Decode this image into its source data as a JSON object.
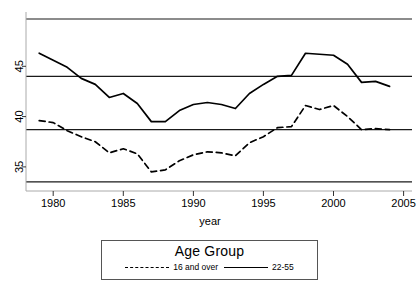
{
  "chart_data": {
    "type": "line",
    "title": "",
    "xlabel": "year",
    "ylabel": "",
    "xlim": [
      1978.2,
      2005.6
    ],
    "ylim": [
      32.6,
      50.4
    ],
    "xticks": [
      1980,
      1985,
      1990,
      1995,
      2000,
      2005
    ],
    "yticks": [
      35,
      40,
      45
    ],
    "grid": false,
    "reference_lines": [
      49.7,
      44.0,
      38.7,
      33.5
    ],
    "legend": {
      "title": "Age Group",
      "position": "below-axes",
      "entries": [
        {
          "label": "16 and over",
          "style": "dashed"
        },
        {
          "label": "22-55",
          "style": "solid"
        }
      ]
    },
    "x": [
      1979,
      1980,
      1981,
      1982,
      1983,
      1984,
      1985,
      1986,
      1987,
      1988,
      1989,
      1990,
      1991,
      1992,
      1993,
      1994,
      1995,
      1996,
      1997,
      1998,
      1999,
      2000,
      2001,
      2002,
      2003,
      2004
    ],
    "series": [
      {
        "name": "22-55",
        "style": "solid",
        "values": [
          46.3,
          45.6,
          44.9,
          43.8,
          43.2,
          41.9,
          42.3,
          41.3,
          39.5,
          39.5,
          40.6,
          41.2,
          41.4,
          41.2,
          40.8,
          42.3,
          43.2,
          44.0,
          44.1,
          46.3,
          46.2,
          46.1,
          45.2,
          43.4,
          43.5,
          43.0
        ]
      },
      {
        "name": "16 and over",
        "style": "dashed",
        "values": [
          39.6,
          39.4,
          38.6,
          38.0,
          37.5,
          36.4,
          36.8,
          36.3,
          34.5,
          34.7,
          35.6,
          36.2,
          36.5,
          36.4,
          36.1,
          37.4,
          38.0,
          38.9,
          39.0,
          41.1,
          40.7,
          41.1,
          40.0,
          38.7,
          38.8,
          38.7
        ]
      }
    ]
  },
  "axis": {
    "ytick_labels": [
      "35",
      "40",
      "45"
    ],
    "xtick_labels": [
      "1980",
      "1985",
      "1990",
      "1995",
      "2000",
      "2005"
    ],
    "x_axis_title": "year"
  },
  "legend": {
    "title": "Age Group",
    "entry_dashed_label": "16 and over",
    "entry_solid_label": "22-55"
  }
}
